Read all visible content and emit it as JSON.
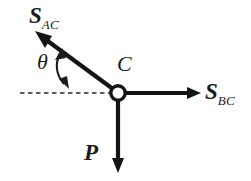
{
  "figure": {
    "type": "force-diagram",
    "background_color": "#ffffff",
    "stroke_color": "#1a1a1a"
  },
  "labels": {
    "force_ac": {
      "symbol": "S",
      "subscript": "AC"
    },
    "force_bc": {
      "symbol": "S",
      "subscript": "BC"
    },
    "load_p": {
      "symbol": "P",
      "subscript": ""
    },
    "joint_c": "C",
    "angle": "θ"
  },
  "geometry": {
    "joint": {
      "x": 118,
      "y": 93,
      "radius": 7
    },
    "vectors": [
      {
        "name": "S_AC",
        "from": [
          118,
          93
        ],
        "to": [
          38,
          34
        ],
        "direction": "up-left"
      },
      {
        "name": "S_BC",
        "from": [
          118,
          93
        ],
        "to": [
          200,
          93
        ],
        "direction": "right"
      },
      {
        "name": "P",
        "from": [
          118,
          93
        ],
        "to": [
          118,
          172
        ],
        "direction": "down"
      }
    ],
    "reference_line": {
      "from": [
        20,
        93
      ],
      "to": [
        112,
        93
      ],
      "style": "dashed"
    },
    "angle_arc": {
      "center": [
        118,
        93
      ],
      "between": [
        "reference_line",
        "S_AC"
      ],
      "double_headed": true
    }
  }
}
